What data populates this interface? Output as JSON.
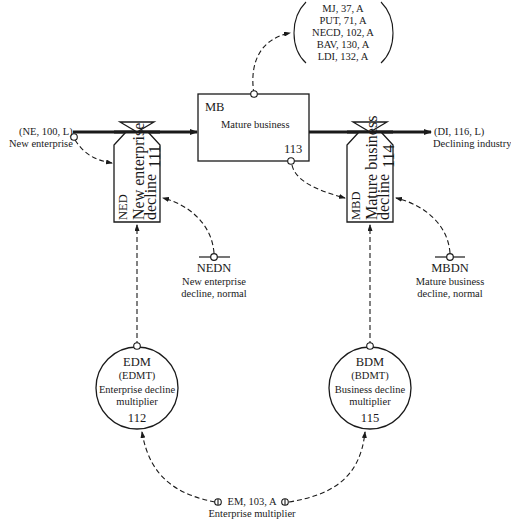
{
  "diagram": {
    "type": "system-dynamics-flow-diagram",
    "sources_sinks": {
      "new_enterprise": {
        "code": "(NE, 100, L)",
        "label": "New enterprise"
      },
      "declining_industry": {
        "code": "(DI, 116, L)",
        "label": "Declining industry"
      }
    },
    "level": {
      "abbr": "MB",
      "label": "Mature business",
      "eq": "113"
    },
    "rates": [
      {
        "abbr": "NED",
        "line1": "New enterprise",
        "line2": "decline",
        "eq": "111"
      },
      {
        "abbr": "MBD",
        "line1": "Mature business",
        "line2": "decline",
        "eq": "114"
      }
    ],
    "auxiliaries": [
      {
        "abbr": "EDM",
        "table": "(EDMT)",
        "line1": "Enterprise decline",
        "line2": "multiplier",
        "eq": "112"
      },
      {
        "abbr": "BDM",
        "table": "(BDMT)",
        "line1": "Business decline",
        "line2": "multiplier",
        "eq": "115"
      }
    ],
    "constants": [
      {
        "abbr": "NEDN",
        "line1": "New enterprise",
        "line2": "decline, normal"
      },
      {
        "abbr": "MBDN",
        "line1": "Mature business",
        "line2": "decline, normal"
      }
    ],
    "multiplier": {
      "code": "EM, 103, A",
      "label": "Enterprise multiplier"
    },
    "mb_outputs": [
      "MJ, 37, A",
      "PUT, 71, A",
      "NECD, 102, A",
      "BAV, 130, A",
      "LDI, 132, A"
    ]
  }
}
